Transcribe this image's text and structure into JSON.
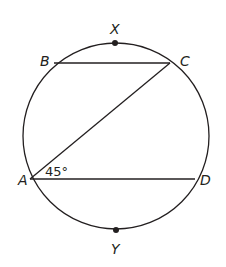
{
  "diagram": {
    "circle": {
      "cx": 116,
      "cy": 136,
      "r": 93
    },
    "points": {
      "A": {
        "label": "A",
        "x": 30,
        "y": 179
      },
      "B": {
        "label": "B",
        "x": 54,
        "y": 63
      },
      "C": {
        "label": "C",
        "x": 170,
        "y": 63
      },
      "D": {
        "label": "D",
        "x": 195,
        "y": 179
      },
      "X": {
        "label": "X",
        "x": 115,
        "y": 43
      },
      "Y": {
        "label": "Y",
        "x": 116,
        "y": 230
      }
    },
    "segments": [
      {
        "from": "B",
        "to": "C"
      },
      {
        "from": "A",
        "to": "C"
      },
      {
        "from": "A",
        "to": "D"
      }
    ],
    "angle": {
      "vertex": "A",
      "value_label": "45°",
      "between": [
        "AC",
        "AD"
      ]
    },
    "colors": {
      "ink": "#231f20",
      "background": "#ffffff"
    }
  }
}
